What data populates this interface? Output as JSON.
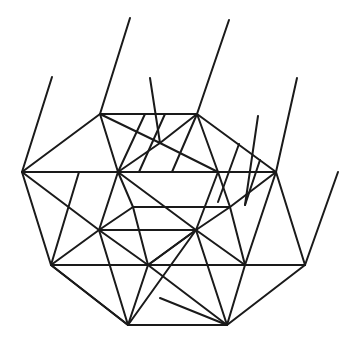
{
  "diagram": {
    "type": "line-drawing",
    "stroke_color": "#1a1a1a",
    "background": "#ffffff",
    "vertices": {
      "A": [
        100,
        114
      ],
      "B": [
        197,
        114
      ],
      "C": [
        276,
        172
      ],
      "D": [
        305,
        265
      ],
      "E": [
        227,
        325
      ],
      "F": [
        128,
        325
      ],
      "G": [
        51,
        265
      ],
      "H": [
        22,
        172
      ],
      "I": [
        118,
        172
      ],
      "J": [
        218,
        172
      ],
      "K": [
        133,
        207
      ],
      "L": [
        230,
        207
      ],
      "M": [
        99,
        230
      ],
      "N": [
        196,
        230
      ],
      "O": [
        148,
        265
      ],
      "P": [
        245,
        265
      ],
      "Q": [
        160,
        143
      ],
      "R": [
        160,
        298
      ]
    },
    "segments": [
      [
        100,
        114,
        197,
        114
      ],
      [
        197,
        114,
        276,
        172
      ],
      [
        276,
        172,
        305,
        265
      ],
      [
        305,
        265,
        227,
        325
      ],
      [
        227,
        325,
        128,
        325
      ],
      [
        128,
        325,
        51,
        265
      ],
      [
        51,
        265,
        22,
        172
      ],
      [
        22,
        172,
        100,
        114
      ],
      [
        22,
        172,
        218,
        172
      ],
      [
        218,
        172,
        276,
        172
      ],
      [
        51,
        265,
        305,
        265
      ],
      [
        99,
        230,
        196,
        230
      ],
      [
        133,
        207,
        230,
        207
      ],
      [
        100,
        114,
        118,
        172
      ],
      [
        118,
        172,
        99,
        230
      ],
      [
        99,
        230,
        51,
        265
      ],
      [
        100,
        114,
        160,
        143
      ],
      [
        160,
        143,
        218,
        172
      ],
      [
        218,
        172,
        276,
        172
      ],
      [
        197,
        114,
        160,
        143
      ],
      [
        160,
        143,
        118,
        172
      ],
      [
        197,
        114,
        218,
        172
      ],
      [
        197,
        114,
        172,
        172
      ],
      [
        22,
        172,
        99,
        230
      ],
      [
        99,
        230,
        128,
        325
      ],
      [
        118,
        172,
        133,
        207
      ],
      [
        133,
        207,
        148,
        265
      ],
      [
        148,
        265,
        128,
        325
      ],
      [
        118,
        172,
        196,
        230
      ],
      [
        196,
        230,
        227,
        325
      ],
      [
        218,
        172,
        230,
        207
      ],
      [
        230,
        207,
        245,
        265
      ],
      [
        245,
        265,
        227,
        325
      ],
      [
        218,
        172,
        196,
        230
      ],
      [
        196,
        230,
        148,
        265
      ],
      [
        276,
        172,
        230,
        207
      ],
      [
        230,
        207,
        196,
        230
      ],
      [
        133,
        207,
        99,
        230
      ],
      [
        51,
        265,
        128,
        325
      ],
      [
        148,
        265,
        227,
        325
      ],
      [
        245,
        265,
        305,
        265
      ],
      [
        128,
        325,
        196,
        230
      ],
      [
        227,
        325,
        160,
        298
      ],
      [
        99,
        230,
        148,
        265
      ],
      [
        148,
        265,
        196,
        230
      ],
      [
        196,
        230,
        245,
        265
      ],
      [
        245,
        265,
        276,
        172
      ],
      [
        79,
        172,
        51,
        265
      ],
      [
        145,
        114,
        118,
        172
      ],
      [
        165,
        114,
        139,
        172
      ],
      [
        239,
        144,
        218,
        202
      ],
      [
        260,
        160,
        245,
        205
      ],
      [
        22,
        172,
        52,
        77
      ],
      [
        100,
        114,
        130,
        18
      ],
      [
        160,
        143,
        150,
        78
      ],
      [
        197,
        114,
        229,
        20
      ],
      [
        305,
        265,
        338,
        172
      ],
      [
        276,
        172,
        297,
        78
      ],
      [
        245,
        205,
        258,
        116
      ]
    ]
  }
}
